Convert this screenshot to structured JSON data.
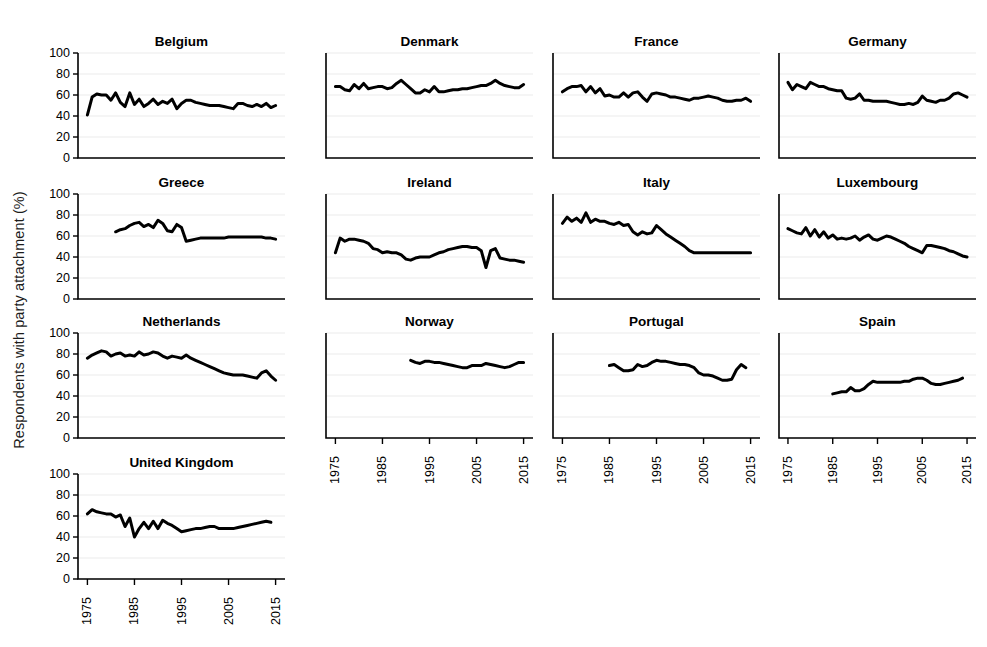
{
  "figure": {
    "ylabel": "Respondents with party attachment (%)",
    "line_color": "#000000",
    "grid_color": "#ebebeb",
    "background": "#ffffff"
  },
  "chart_data": {
    "type": "line",
    "title": "",
    "xlabel": "",
    "ylabel": "Respondents with party attachment (%)",
    "xlim": [
      1973,
      2017
    ],
    "ylim": [
      0,
      100
    ],
    "yticks": [
      0,
      20,
      40,
      60,
      80,
      100
    ],
    "xticks": [
      1975,
      1985,
      1995,
      2005,
      2015
    ],
    "grid": true,
    "legend": "none",
    "layout": {
      "rows": 4,
      "cols": 4,
      "shared_x": true,
      "shared_y": true
    },
    "panels": [
      {
        "name": "Belgium",
        "row": 0,
        "col": 0,
        "x": [
          1975,
          1976,
          1977,
          1978,
          1979,
          1980,
          1981,
          1982,
          1983,
          1984,
          1985,
          1986,
          1987,
          1988,
          1989,
          1990,
          1991,
          1992,
          1993,
          1994,
          1995,
          1996,
          1997,
          1998,
          1999,
          2000,
          2001,
          2002,
          2003,
          2004,
          2005,
          2006,
          2007,
          2008,
          2009,
          2010,
          2011,
          2012,
          2013,
          2014,
          2015
        ],
        "y": [
          41,
          58,
          61,
          60,
          60,
          55,
          62,
          53,
          49,
          62,
          51,
          56,
          49,
          52,
          56,
          51,
          54,
          52,
          56,
          47,
          52,
          55,
          55,
          53,
          52,
          51,
          50,
          50,
          50,
          49,
          48,
          47,
          52,
          52,
          50,
          49,
          51,
          49,
          52,
          48,
          50
        ]
      },
      {
        "name": "Denmark",
        "row": 0,
        "col": 1,
        "x": [
          1975,
          1976,
          1977,
          1978,
          1979,
          1980,
          1981,
          1982,
          1983,
          1984,
          1985,
          1986,
          1987,
          1988,
          1989,
          1990,
          1991,
          1992,
          1993,
          1994,
          1995,
          1996,
          1997,
          1998,
          1999,
          2000,
          2001,
          2002,
          2003,
          2004,
          2005,
          2006,
          2007,
          2008,
          2009,
          2010,
          2011,
          2012,
          2013,
          2014,
          2015
        ],
        "y": [
          68,
          68,
          65,
          64,
          70,
          66,
          71,
          66,
          67,
          68,
          68,
          66,
          67,
          71,
          74,
          70,
          66,
          62,
          62,
          65,
          63,
          68,
          63,
          63,
          64,
          65,
          65,
          66,
          66,
          67,
          68,
          69,
          69,
          71,
          74,
          71,
          69,
          68,
          67,
          67,
          70
        ]
      },
      {
        "name": "France",
        "row": 0,
        "col": 2,
        "x": [
          1975,
          1976,
          1977,
          1978,
          1979,
          1980,
          1981,
          1982,
          1983,
          1984,
          1985,
          1986,
          1987,
          1988,
          1989,
          1990,
          1991,
          1992,
          1993,
          1994,
          1995,
          1996,
          1997,
          1998,
          1999,
          2000,
          2001,
          2002,
          2003,
          2004,
          2005,
          2006,
          2007,
          2008,
          2009,
          2010,
          2011,
          2012,
          2013,
          2014,
          2015
        ],
        "y": [
          63,
          66,
          68,
          68,
          69,
          63,
          68,
          62,
          66,
          59,
          60,
          58,
          58,
          62,
          58,
          62,
          63,
          58,
          54,
          61,
          62,
          61,
          60,
          58,
          58,
          57,
          56,
          55,
          57,
          57,
          58,
          59,
          58,
          57,
          55,
          54,
          54,
          55,
          55,
          57,
          54
        ]
      },
      {
        "name": "Germany",
        "row": 0,
        "col": 3,
        "x": [
          1975,
          1976,
          1977,
          1978,
          1979,
          1980,
          1981,
          1982,
          1983,
          1984,
          1985,
          1986,
          1987,
          1988,
          1989,
          1990,
          1991,
          1992,
          1993,
          1994,
          1995,
          1996,
          1997,
          1998,
          1999,
          2000,
          2001,
          2002,
          2003,
          2004,
          2005,
          2006,
          2007,
          2008,
          2009,
          2010,
          2011,
          2012,
          2013,
          2014,
          2015
        ],
        "y": [
          72,
          65,
          70,
          68,
          66,
          72,
          70,
          68,
          68,
          66,
          65,
          64,
          64,
          57,
          56,
          57,
          61,
          55,
          55,
          54,
          54,
          54,
          54,
          53,
          52,
          51,
          51,
          52,
          51,
          53,
          59,
          55,
          54,
          53,
          55,
          55,
          57,
          61,
          62,
          60,
          58
        ]
      },
      {
        "name": "Greece",
        "row": 1,
        "col": 0,
        "x": [
          1981,
          1982,
          1983,
          1984,
          1985,
          1986,
          1987,
          1988,
          1989,
          1990,
          1991,
          1992,
          1993,
          1994,
          1995,
          1996,
          1997,
          1998,
          1999,
          2000,
          2001,
          2002,
          2003,
          2004,
          2005,
          2006,
          2007,
          2008,
          2009,
          2010,
          2011,
          2012,
          2013,
          2014,
          2015
        ],
        "y": [
          64,
          66,
          67,
          70,
          72,
          73,
          69,
          71,
          68,
          75,
          72,
          65,
          64,
          71,
          68,
          55,
          56,
          57,
          58,
          58,
          58,
          58,
          58,
          58,
          59,
          59,
          59,
          59,
          59,
          59,
          59,
          59,
          58,
          58,
          57
        ]
      },
      {
        "name": "Ireland",
        "row": 1,
        "col": 1,
        "x": [
          1975,
          1976,
          1977,
          1978,
          1979,
          1980,
          1981,
          1982,
          1983,
          1984,
          1985,
          1986,
          1987,
          1988,
          1989,
          1990,
          1991,
          1992,
          1993,
          1994,
          1995,
          1996,
          1997,
          1998,
          1999,
          2000,
          2001,
          2002,
          2003,
          2004,
          2005,
          2006,
          2007,
          2008,
          2009,
          2010,
          2011,
          2012,
          2013,
          2014,
          2015
        ],
        "y": [
          44,
          58,
          55,
          57,
          57,
          56,
          55,
          53,
          48,
          47,
          44,
          45,
          44,
          44,
          42,
          38,
          37,
          39,
          40,
          40,
          40,
          42,
          44,
          45,
          47,
          48,
          49,
          50,
          50,
          49,
          49,
          46,
          30,
          46,
          48,
          39,
          38,
          37,
          37,
          36,
          35
        ]
      },
      {
        "name": "Italy",
        "row": 1,
        "col": 2,
        "x": [
          1975,
          1976,
          1977,
          1978,
          1979,
          1980,
          1981,
          1982,
          1983,
          1984,
          1985,
          1986,
          1987,
          1988,
          1989,
          1990,
          1991,
          1992,
          1993,
          1994,
          1995,
          1996,
          1997,
          1998,
          1999,
          2000,
          2001,
          2002,
          2003,
          2004,
          2005,
          2006,
          2007,
          2008,
          2009,
          2010,
          2011,
          2012,
          2013,
          2014,
          2015
        ],
        "y": [
          72,
          78,
          74,
          77,
          73,
          82,
          73,
          76,
          74,
          74,
          72,
          71,
          73,
          70,
          71,
          64,
          61,
          64,
          62,
          63,
          70,
          66,
          62,
          59,
          56,
          53,
          50,
          46,
          44,
          44,
          44,
          44,
          44,
          44,
          44,
          44,
          44,
          44,
          44,
          44,
          44
        ]
      },
      {
        "name": "Luxembourg",
        "row": 1,
        "col": 3,
        "x": [
          1975,
          1976,
          1977,
          1978,
          1979,
          1980,
          1981,
          1982,
          1983,
          1984,
          1985,
          1986,
          1987,
          1988,
          1989,
          1990,
          1991,
          1992,
          1993,
          1994,
          1995,
          1996,
          1997,
          1998,
          1999,
          2000,
          2001,
          2002,
          2003,
          2004,
          2005,
          2006,
          2007,
          2008,
          2009,
          2010,
          2011,
          2012,
          2013,
          2014,
          2015
        ],
        "y": [
          67,
          65,
          63,
          62,
          68,
          60,
          66,
          59,
          64,
          58,
          61,
          57,
          58,
          57,
          58,
          60,
          56,
          59,
          61,
          57,
          56,
          58,
          60,
          59,
          57,
          55,
          53,
          50,
          48,
          46,
          44,
          51,
          51,
          50,
          49,
          48,
          46,
          45,
          43,
          41,
          40
        ]
      },
      {
        "name": "Netherlands",
        "row": 2,
        "col": 0,
        "x": [
          1975,
          1976,
          1977,
          1978,
          1979,
          1980,
          1981,
          1982,
          1983,
          1984,
          1985,
          1986,
          1987,
          1988,
          1989,
          1990,
          1991,
          1992,
          1993,
          1994,
          1995,
          1996,
          1997,
          1998,
          1999,
          2000,
          2001,
          2002,
          2003,
          2004,
          2005,
          2006,
          2007,
          2008,
          2009,
          2010,
          2011,
          2012,
          2013,
          2014,
          2015
        ],
        "y": [
          76,
          79,
          81,
          83,
          82,
          78,
          80,
          81,
          78,
          79,
          78,
          82,
          79,
          80,
          82,
          81,
          78,
          76,
          78,
          77,
          76,
          79,
          76,
          74,
          72,
          70,
          68,
          66,
          64,
          62,
          61,
          60,
          60,
          60,
          59,
          58,
          57,
          62,
          64,
          59,
          55
        ]
      },
      {
        "name": "Norway",
        "row": 2,
        "col": 1,
        "x": [
          1991,
          1992,
          1993,
          1994,
          1995,
          1996,
          1997,
          1998,
          1999,
          2000,
          2001,
          2002,
          2003,
          2004,
          2005,
          2006,
          2007,
          2008,
          2009,
          2010,
          2011,
          2012,
          2013,
          2014,
          2015
        ],
        "y": [
          74,
          72,
          71,
          73,
          73,
          72,
          72,
          71,
          70,
          69,
          68,
          67,
          67,
          69,
          69,
          69,
          71,
          70,
          69,
          68,
          67,
          68,
          70,
          72,
          72
        ]
      },
      {
        "name": "Portugal",
        "row": 2,
        "col": 2,
        "x": [
          1985,
          1986,
          1987,
          1988,
          1989,
          1990,
          1991,
          1992,
          1993,
          1994,
          1995,
          1996,
          1997,
          1998,
          1999,
          2000,
          2001,
          2002,
          2003,
          2004,
          2005,
          2006,
          2007,
          2008,
          2009,
          2010,
          2011,
          2012,
          2013,
          2014
        ],
        "y": [
          69,
          70,
          67,
          64,
          64,
          65,
          70,
          68,
          69,
          72,
          74,
          73,
          73,
          72,
          71,
          70,
          70,
          69,
          67,
          62,
          60,
          60,
          59,
          57,
          55,
          55,
          56,
          65,
          70,
          67
        ]
      },
      {
        "name": "Spain",
        "row": 2,
        "col": 3,
        "x": [
          1985,
          1986,
          1987,
          1988,
          1989,
          1990,
          1991,
          1992,
          1993,
          1994,
          1995,
          1996,
          1997,
          1998,
          1999,
          2000,
          2001,
          2002,
          2003,
          2004,
          2005,
          2006,
          2007,
          2008,
          2009,
          2010,
          2011,
          2012,
          2013,
          2014
        ],
        "y": [
          42,
          43,
          44,
          44,
          48,
          45,
          45,
          47,
          51,
          54,
          53,
          53,
          53,
          53,
          53,
          53,
          54,
          54,
          56,
          57,
          57,
          55,
          52,
          51,
          51,
          52,
          53,
          54,
          55,
          57
        ]
      },
      {
        "name": "United Kingdom",
        "row": 3,
        "col": 0,
        "x": [
          1975,
          1976,
          1977,
          1978,
          1979,
          1980,
          1981,
          1982,
          1983,
          1984,
          1985,
          1986,
          1987,
          1988,
          1989,
          1990,
          1991,
          1992,
          1993,
          1994,
          1995,
          1996,
          1997,
          1998,
          1999,
          2000,
          2001,
          2002,
          2003,
          2004,
          2005,
          2006,
          2007,
          2008,
          2009,
          2010,
          2011,
          2012,
          2013,
          2014,
          2015
        ],
        "y": [
          62,
          66,
          64,
          63,
          62,
          62,
          59,
          61,
          50,
          58,
          40,
          48,
          54,
          48,
          55,
          48,
          56,
          53,
          51,
          48,
          45,
          46,
          47,
          48,
          48,
          49,
          50,
          50,
          48,
          48,
          48,
          48,
          49,
          50,
          51,
          52,
          53,
          54,
          55,
          54
        ]
      }
    ]
  },
  "axes": {
    "yticks": [
      "0",
      "20",
      "40",
      "60",
      "80",
      "100"
    ],
    "xticks": [
      "1975",
      "1985",
      "1995",
      "2005",
      "2015"
    ]
  }
}
